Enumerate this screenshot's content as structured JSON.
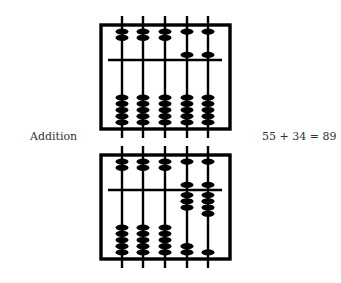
{
  "operation_label": "Addition",
  "equation": "55 + 34 = 89",
  "colors": {
    "ink": "#000000",
    "text": "#333333",
    "background": "#ffffff"
  },
  "abaci": [
    {
      "name": "top",
      "value": 55,
      "frame": {
        "x": 101,
        "y": 25,
        "w": 129,
        "h": 104
      },
      "beam_y": 60,
      "rods": [
        {
          "heaven_down": false,
          "earth_up": 0
        },
        {
          "heaven_down": false,
          "earth_up": 0
        },
        {
          "heaven_down": false,
          "earth_up": 0
        },
        {
          "heaven_down": true,
          "earth_up": 0
        },
        {
          "heaven_down": true,
          "earth_up": 0
        }
      ]
    },
    {
      "name": "bottom",
      "value": 89,
      "frame": {
        "x": 101,
        "y": 155,
        "w": 129,
        "h": 104
      },
      "beam_y": 190,
      "rods": [
        {
          "heaven_down": false,
          "earth_up": 0
        },
        {
          "heaven_down": false,
          "earth_up": 0
        },
        {
          "heaven_down": false,
          "earth_up": 0
        },
        {
          "heaven_down": true,
          "earth_up": 3
        },
        {
          "heaven_down": true,
          "earth_up": 4
        }
      ]
    }
  ],
  "rod_x": [
    122,
    143,
    165,
    187,
    208
  ]
}
